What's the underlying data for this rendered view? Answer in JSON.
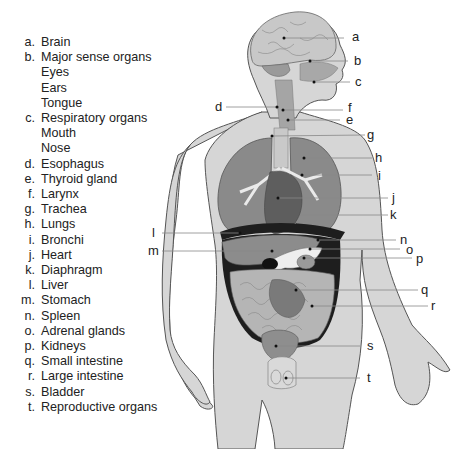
{
  "legend": {
    "items": [
      {
        "letter": "a.",
        "label": "Brain"
      },
      {
        "letter": "b.",
        "label": "Major sense organs"
      },
      {
        "letter": "",
        "label": "Eyes"
      },
      {
        "letter": "",
        "label": "Ears"
      },
      {
        "letter": "",
        "label": "Tongue"
      },
      {
        "letter": "c.",
        "label": "Respiratory organs"
      },
      {
        "letter": "",
        "label": "Mouth"
      },
      {
        "letter": "",
        "label": "Nose"
      },
      {
        "letter": "d.",
        "label": "Esophagus"
      },
      {
        "letter": "e.",
        "label": "Thyroid gland"
      },
      {
        "letter": "f.",
        "label": "Larynx"
      },
      {
        "letter": "g.",
        "label": "Trachea"
      },
      {
        "letter": "h.",
        "label": "Lungs"
      },
      {
        "letter": "i.",
        "label": "Bronchi"
      },
      {
        "letter": "j.",
        "label": "Heart"
      },
      {
        "letter": "k.",
        "label": "Diaphragm"
      },
      {
        "letter": "l.",
        "label": "Liver"
      },
      {
        "letter": "m.",
        "label": "Stomach"
      },
      {
        "letter": "n.",
        "label": "Spleen"
      },
      {
        "letter": "o.",
        "label": "Adrenal glands"
      },
      {
        "letter": "p.",
        "label": "Kidneys"
      },
      {
        "letter": "q.",
        "label": "Small intestine"
      },
      {
        "letter": "r.",
        "label": "Large intestine"
      },
      {
        "letter": "s.",
        "label": "Bladder"
      },
      {
        "letter": "t.",
        "label": "Reproductive organs"
      }
    ]
  },
  "callouts": {
    "a": "a",
    "b": "b",
    "c": "c",
    "d": "d",
    "e": "e",
    "f": "f",
    "g": "g",
    "h": "h",
    "i": "i",
    "j": "j",
    "k": "k",
    "l": "l",
    "m": "m",
    "n": "n",
    "o": "o",
    "p": "p",
    "q": "q",
    "r": "r",
    "s": "s",
    "t": "t"
  },
  "colors": {
    "skin": "#d6d6d6",
    "outline": "#555555",
    "lung": "#8a8a8a",
    "heart": "#5e5e5e",
    "liver": "#8c8c8c",
    "intestine": "#b5b5b5",
    "dark": "#1e1e1e",
    "leader": "#888888"
  }
}
